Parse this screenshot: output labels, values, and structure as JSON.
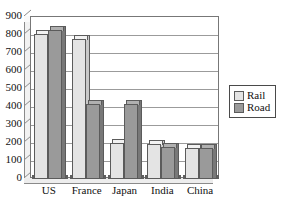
{
  "chart_data": {
    "type": "bar",
    "title": "",
    "subtitle": "",
    "xlabel": "",
    "ylabel": "",
    "categories": [
      "US",
      "France",
      "Japan",
      "India",
      "China"
    ],
    "series": [
      {
        "name": "Rail",
        "color": "#e4e4e4",
        "values": [
          805,
          780,
          200,
          195,
          175
        ]
      },
      {
        "name": "Road",
        "color": "#9a9a9a",
        "values": [
          830,
          415,
          415,
          180,
          170
        ]
      }
    ],
    "ylim": [
      0,
      900
    ],
    "ytick_step": 100,
    "yticks": [
      0,
      100,
      200,
      300,
      400,
      500,
      600,
      700,
      800,
      900
    ],
    "ytick_labels": [
      "0",
      "100",
      "200",
      "300",
      "400",
      "500",
      "600",
      "700",
      "800",
      "900"
    ],
    "grid": true,
    "grid_axis": "y",
    "legend_position": "right",
    "legend_entries": [
      "Rail",
      "Road"
    ],
    "style": "3d-bars",
    "background": "#ffffff",
    "axis_color": "#777777",
    "grid_color": "#9b9b9b"
  }
}
